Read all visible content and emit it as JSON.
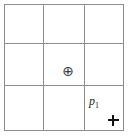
{
  "figure": {
    "title": "",
    "background_color": "#ffffff",
    "grid": {
      "rows": 3,
      "columns": 3,
      "line_color": "#8c8c8c",
      "border_color": "#8c8c8c"
    },
    "markers": [
      {
        "id": "circled-plus",
        "glyph": "⊕",
        "semantic_name": "circled-plus-icon",
        "cell_row": 2,
        "cell_column": 2,
        "label": "",
        "color": "#3a3a3a"
      },
      {
        "id": "point-p1",
        "glyph": "+",
        "semantic_name": "plus-point-marker",
        "cell_row": 3,
        "cell_column": 3,
        "label_base": "p",
        "label_subscript": "1",
        "color": "#111111"
      }
    ]
  }
}
